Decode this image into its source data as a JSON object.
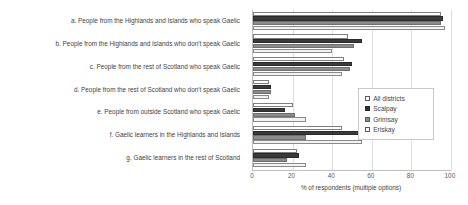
{
  "chart_data": {
    "type": "bar",
    "orientation": "horizontal",
    "title": "",
    "xlabel": "% of respondents (multiple options)",
    "ylabel": "",
    "xlim": [
      0,
      100
    ],
    "xticks": [
      0,
      20,
      40,
      60,
      80,
      100
    ],
    "grid": true,
    "legend_position": "center-right",
    "categories": [
      "a. People from the Highlands and Islands who speak Gaelic",
      "b. People from the Highlands and Islands who don't speak Gaelic",
      "c. People from the rest of Scotland who speak Gaelic",
      "d. People from the rest of Scotland who don't speak Gaelic",
      "e. People from outside Scotland who speak Gaelic",
      "f. Gaelic learners in the Highlands and Islands",
      "g. Gaelic learners in the rest of Scotland"
    ],
    "series": [
      {
        "name": "All districts",
        "color": "#ffffff",
        "values": [
          95,
          48,
          46,
          8,
          20,
          45,
          22
        ]
      },
      {
        "name": "Scalpay",
        "color": "#2f2f2f",
        "values": [
          96,
          55,
          50,
          9,
          16,
          55,
          23
        ]
      },
      {
        "name": "Grimsay",
        "color": "#8c8c8c",
        "values": [
          95,
          51,
          49,
          9,
          21,
          27,
          17
        ]
      },
      {
        "name": "Eriskay",
        "color": "#fbfbfb",
        "values": [
          97,
          40,
          45,
          8,
          27,
          55,
          27
        ]
      }
    ]
  },
  "axis": {
    "x_title": "% of respondents (multiple options)",
    "tick_labels": [
      "0",
      "20",
      "40",
      "60",
      "80",
      "100"
    ]
  },
  "legend": {
    "entries": [
      {
        "label": "All districts"
      },
      {
        "label": "Scalpay"
      },
      {
        "label": "Grimsay"
      },
      {
        "label": "Eriskay"
      }
    ]
  }
}
